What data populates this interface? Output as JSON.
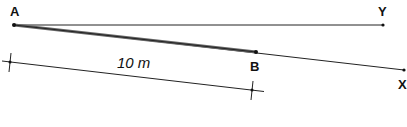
{
  "diagram": {
    "points": {
      "A": {
        "label": "A",
        "x": 14,
        "y": 25
      },
      "B": {
        "label": "B",
        "x": 256,
        "y": 52
      },
      "X": {
        "label": "X",
        "x": 404,
        "y": 70
      },
      "Y": {
        "label": "Y",
        "x": 383,
        "y": 25
      }
    },
    "lines": [
      {
        "from": "A",
        "to": "Y",
        "style": "thin"
      },
      {
        "from": "A",
        "to": "X",
        "style": "thin"
      },
      {
        "from": "A",
        "to": "B",
        "style": "thick"
      }
    ],
    "dimension": {
      "label": "10 m",
      "start": {
        "x": 10,
        "y": 62
      },
      "end": {
        "x": 252,
        "y": 90
      }
    },
    "colors": {
      "line": "#222222",
      "thick_line": "#555555"
    }
  }
}
